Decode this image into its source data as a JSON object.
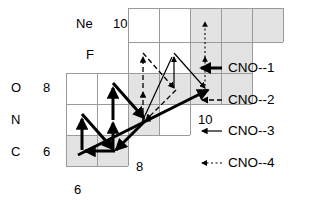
{
  "figure": {
    "type": "nuclide-chart-diagram",
    "title": "",
    "grid": {
      "cell_size": 31,
      "origin_x": 66,
      "origin_y": 8,
      "shade_color": "#e3e3e3",
      "line_color": "#9a9a9a",
      "rows": [
        {
          "row": 0,
          "y": 8,
          "x_start": 128,
          "cells": 5,
          "shaded": [
            2,
            3,
            4
          ]
        },
        {
          "row": 1,
          "y": 42,
          "x_start": 128,
          "cells": 4,
          "shaded": [
            2,
            3
          ]
        },
        {
          "row": 2,
          "y": 73,
          "x_start": 66,
          "cells": 6,
          "shaded": [
            2,
            3,
            4,
            5
          ]
        },
        {
          "row": 3,
          "y": 104,
          "x_start": 66,
          "cells": 4,
          "shaded": [
            2,
            3
          ]
        },
        {
          "row": 4,
          "y": 135,
          "x_start": 66,
          "cells": 2,
          "shaded": [
            0,
            1
          ]
        }
      ]
    },
    "element_labels": [
      {
        "name": "Ne",
        "x": 76,
        "y": 17
      },
      {
        "name": "F",
        "x": 86,
        "y": 48
      },
      {
        "name": "O",
        "x": 11,
        "y": 81
      },
      {
        "name": "N",
        "x": 11,
        "y": 113
      },
      {
        "name": "C",
        "x": 11,
        "y": 145
      }
    ],
    "number_labels": [
      {
        "value": "10",
        "x": 113,
        "y": 17
      },
      {
        "value": "8",
        "x": 43,
        "y": 81
      },
      {
        "value": "6",
        "x": 43,
        "y": 145
      },
      {
        "value": "10",
        "x": 198,
        "y": 113
      },
      {
        "value": "8",
        "x": 136,
        "y": 160
      },
      {
        "value": "6",
        "x": 74,
        "y": 183
      }
    ],
    "legend": {
      "items": [
        {
          "label": "CNO--1",
          "style": "thick-solid",
          "stroke_width": 3,
          "dash": "none",
          "x": 228,
          "y": 68
        },
        {
          "label": "CNO--2",
          "style": "dashed",
          "stroke_width": 1.2,
          "dash": "5,3",
          "x": 228,
          "y": 100
        },
        {
          "label": "CNO--3",
          "style": "thin-solid",
          "stroke_width": 1.2,
          "dash": "none",
          "x": 228,
          "y": 131
        },
        {
          "label": "CNO--4",
          "style": "dotted",
          "stroke_width": 1.2,
          "dash": "2,2.5",
          "x": 228,
          "y": 163
        }
      ],
      "marker_x_start": 200,
      "marker_x_end": 222
    },
    "cycles": {
      "cno1_color": "#000000",
      "cno2_color": "#000000",
      "cno3_color": "#000000",
      "cno4_color": "#000000"
    }
  }
}
